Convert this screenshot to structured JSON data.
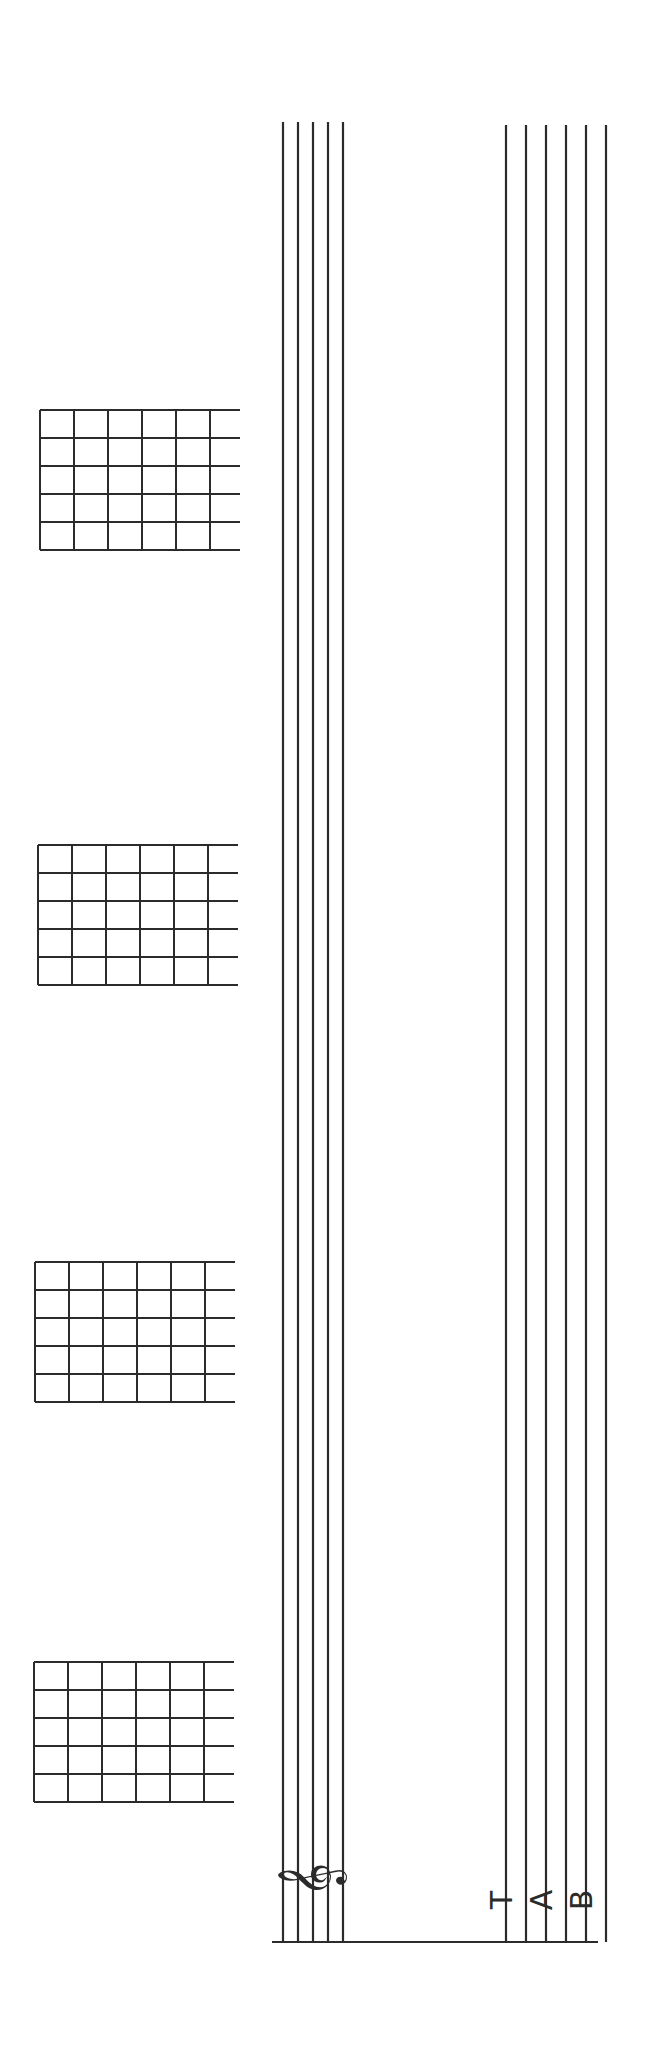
{
  "page": {
    "width": 646,
    "height": 2048,
    "rotation": "90deg-counterclockwise"
  },
  "staff": {
    "clef_symbol": "𝄞",
    "clef_name": "treble-clef",
    "lines": 5,
    "xs": [
      283,
      298,
      313,
      328,
      343
    ],
    "y_top": 122,
    "y_bottom": 1942
  },
  "tab": {
    "letters": [
      "T",
      "A",
      "B"
    ],
    "lines": 6,
    "xs": [
      506,
      526,
      546,
      566,
      586,
      606
    ],
    "y_top": 125,
    "y_bottom": 1942
  },
  "bracket": {
    "y": 1942,
    "x_start": 272,
    "x_end": 598
  },
  "chord_boxes": [
    {
      "x": 40,
      "y": 410,
      "cell_w": 34,
      "cell_h": 28
    },
    {
      "x": 38,
      "y": 845,
      "cell_w": 34,
      "cell_h": 28
    },
    {
      "x": 35,
      "y": 1262,
      "cell_w": 34,
      "cell_h": 28
    },
    {
      "x": 34,
      "y": 1662,
      "cell_w": 34,
      "cell_h": 28
    }
  ],
  "colors": {
    "ink": "#2b2b2b",
    "paper": "#ffffff"
  }
}
